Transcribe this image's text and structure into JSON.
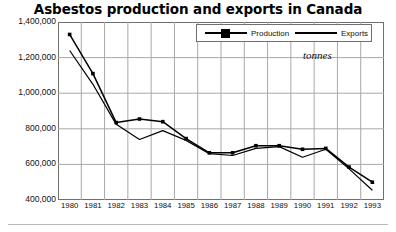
{
  "chart_data": {
    "type": "line",
    "title": "Asbestos production and exports in Canada",
    "xlabel": "",
    "ylabel": "",
    "units_note": "tonnes",
    "grid": true,
    "legend_position": "top-center-inside",
    "categories": [
      "1980",
      "1981",
      "1982",
      "1983",
      "1984",
      "1985",
      "1986",
      "1987",
      "1988",
      "1989",
      "1990",
      "1991",
      "1992",
      "1993"
    ],
    "x": [
      1980,
      1981,
      1982,
      1983,
      1984,
      1985,
      1986,
      1987,
      1988,
      1989,
      1990,
      1991,
      1992,
      1993
    ],
    "ylim": [
      400000,
      1400000
    ],
    "yticks": [
      400000,
      600000,
      800000,
      1000000,
      1200000,
      1400000
    ],
    "ytick_labels": [
      "400,000",
      "600,000",
      "800,000",
      "1,000,000",
      "1,200,000",
      "1,400,000"
    ],
    "series": [
      {
        "name": "Production",
        "marker": "square",
        "color": "#000000",
        "values": [
          1330000,
          1110000,
          835000,
          855000,
          840000,
          745000,
          665000,
          665000,
          705000,
          705000,
          685000,
          690000,
          585000,
          500000
        ]
      },
      {
        "name": "Exports",
        "marker": "none",
        "color": "#000000",
        "values": [
          1240000,
          1050000,
          825000,
          740000,
          790000,
          735000,
          660000,
          650000,
          690000,
          700000,
          640000,
          685000,
          575000,
          455000
        ]
      }
    ]
  },
  "legend": {
    "entries": [
      {
        "label": "Production"
      },
      {
        "label": "Exports"
      }
    ]
  },
  "colors": {
    "line": "#000000",
    "grid": "#a8a8a8",
    "frame": "#6f6f6f",
    "background": "#ffffff",
    "rule": "#b9b9b9"
  }
}
